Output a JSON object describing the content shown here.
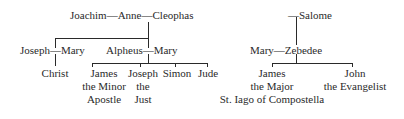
{
  "left_tree": {
    "grandparents": "Joachim—Anne—Cleophas",
    "couple_1": "Joseph—Mary",
    "couple_2": "Alpheus—Mary",
    "child_1": "Christ",
    "children_2": [
      {
        "lines": [
          "James",
          "the Minor",
          "Apostle"
        ]
      },
      {
        "lines": [
          "Joseph",
          "the",
          "Just"
        ]
      },
      {
        "lines": [
          "Simon"
        ]
      },
      {
        "lines": [
          "Jude"
        ]
      }
    ]
  },
  "right_tree": {
    "grandparent": "—Salome",
    "couple": "Mary—Zebedee",
    "children": [
      {
        "lines": [
          "James",
          "the Major",
          "St. Iago of Compostella"
        ]
      },
      {
        "lines": [
          "John",
          "the Evangelist"
        ]
      }
    ]
  }
}
